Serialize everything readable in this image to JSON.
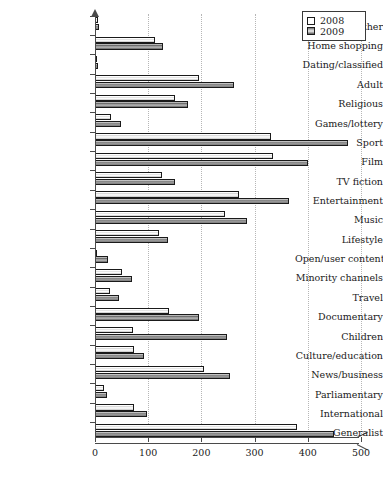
{
  "chart_data": {
    "type": "bar",
    "orientation": "horizontal",
    "title": "",
    "xlabel": "",
    "ylabel": "",
    "xlim": [
      0,
      500
    ],
    "xticks": [
      0,
      100,
      200,
      300,
      400,
      500
    ],
    "xtick_labels": [
      "0",
      "100",
      "200",
      "300",
      "400",
      "500"
    ],
    "grid": "vertical-dotted",
    "legend_position": "top-right",
    "categories": [
      "Weather",
      "Home shopping",
      "Dating/classified",
      "Adult",
      "Religious",
      "Games/lottery",
      "Sport",
      "Film",
      "TV fiction",
      "Entertainment",
      "Music",
      "Lifestyle",
      "Open/user content",
      "Minority channels",
      "Travel",
      "Documentary",
      "Children",
      "Culture/education",
      "News/business",
      "Parliamentary",
      "International",
      "Generalist"
    ],
    "series": [
      {
        "name": "2008",
        "color": "#ffffff",
        "values": [
          5,
          112,
          4,
          195,
          150,
          30,
          330,
          335,
          125,
          270,
          245,
          120,
          2,
          50,
          28,
          140,
          72,
          73,
          205,
          17,
          73,
          380
        ]
      },
      {
        "name": "2009",
        "color": "#8a8a8a",
        "values": [
          8,
          128,
          6,
          262,
          175,
          48,
          476,
          400,
          150,
          365,
          285,
          138,
          25,
          70,
          45,
          195,
          248,
          92,
          253,
          22,
          97,
          450
        ]
      }
    ]
  },
  "legend": {
    "entries": [
      {
        "label": "2008",
        "swatch": "legend-swatch-2008"
      },
      {
        "label": "2009",
        "swatch": "legend-swatch-2009"
      }
    ]
  },
  "axis": {
    "x_axis_name": "value-axis",
    "y_axis_name": "category-axis"
  }
}
